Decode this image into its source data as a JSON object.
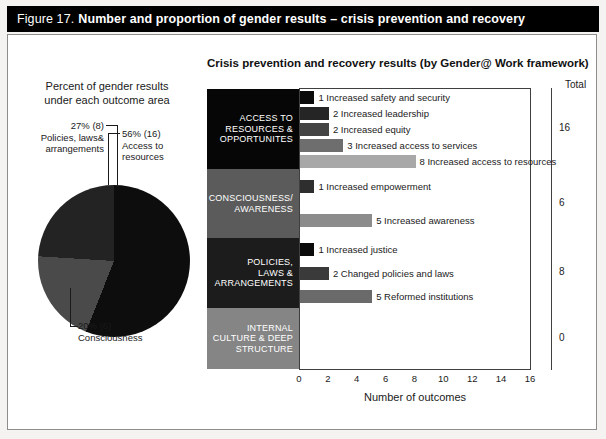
{
  "figure": {
    "label": "Figure 17.",
    "title": "Number and proportion of gender results – crisis prevention and recovery"
  },
  "pie_panel": {
    "heading_line1": "Percent of gender results",
    "heading_line2": "under each outcome area",
    "callouts": {
      "access": {
        "value": "56% (16)",
        "line2": "Access to",
        "line3": "resources"
      },
      "policies": {
        "value": "27% (8)",
        "line2": "Policies, laws&",
        "line3": "arrangements"
      },
      "consciousness": {
        "value": "20% (6)",
        "line2": "Consciousness"
      }
    }
  },
  "bar_panel": {
    "title": "Crisis prevention and recovery results (by Gender@ Work framework)",
    "total_header": "Total",
    "xlabel": "Number of outcomes"
  },
  "chart_data": [
    {
      "type": "pie",
      "title": "Percent of gender results under each outcome area",
      "labels": [
        "Access to resources",
        "Consciousness",
        "Policies, laws& arrangements"
      ],
      "values": [
        16,
        6,
        8
      ],
      "percents": [
        56,
        20,
        27
      ],
      "colors": [
        "#0d0d0d",
        "#4a4a4a",
        "#232323"
      ],
      "legend": "callouts"
    },
    {
      "type": "bar",
      "orientation": "horizontal",
      "title": "Crisis prevention and recovery results (by Gender@ Work framework)",
      "xlabel": "Number of outcomes",
      "ylabel": "",
      "xlim": [
        0,
        16
      ],
      "xticks": [
        0,
        2,
        4,
        6,
        8,
        10,
        12,
        14,
        16
      ],
      "grid": false,
      "groups": [
        {
          "name": "ACCESS TO RESOURCES & OPPORTUNITES",
          "name_lines": [
            "ACCESS TO",
            "RESOURCES &",
            "OPPORTUNITES"
          ],
          "block_color": "#060606",
          "total": "16",
          "bars": [
            {
              "value": 1,
              "label": "Increased safety and security",
              "color": "#0b0b0b"
            },
            {
              "value": 2,
              "label": "Increased leadership",
              "color": "#252525"
            },
            {
              "value": 2,
              "label": "Increased equity",
              "color": "#444444"
            },
            {
              "value": 3,
              "label": "Increased access to services",
              "color": "#6e6e6e"
            },
            {
              "value": 8,
              "label": "Increased access to resources",
              "color": "#a8a8a8"
            }
          ]
        },
        {
          "name": "CONSCIOUSNESS/ AWARENESS",
          "name_lines": [
            "CONSCIOUSNESS/",
            "AWARENESS"
          ],
          "block_color": "#5b5b5b",
          "total": "6",
          "bars": [
            {
              "value": 1,
              "label": "Increased empowerment",
              "color": "#2e2e2e"
            },
            {
              "value": 5,
              "label": "Increased awareness",
              "color": "#8c8c8c"
            }
          ]
        },
        {
          "name": "POLICIES, LAWS & ARRANGEMENTS",
          "name_lines": [
            "POLICIES,",
            "LAWS &",
            "ARRANGEMENTS"
          ],
          "block_color": "#1c1c1c",
          "total": "8",
          "bars": [
            {
              "value": 1,
              "label": "Increased justice",
              "color": "#0b0b0b"
            },
            {
              "value": 2,
              "label": "Changed policies and laws",
              "color": "#3a3a3a"
            },
            {
              "value": 5,
              "label": "Reformed institutions",
              "color": "#6a6a6a"
            }
          ]
        },
        {
          "name": "INTERNAL CULTURE & DEEP STRUCTURE",
          "name_lines": [
            "INTERNAL",
            "CULTURE & DEEP",
            "STRUCTURE"
          ],
          "block_color": "#858585",
          "total": "0",
          "bars": []
        }
      ]
    }
  ]
}
